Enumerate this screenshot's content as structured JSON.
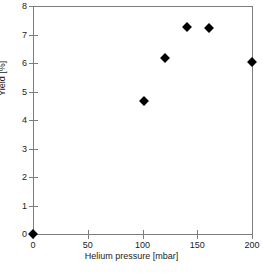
{
  "chart_data": {
    "type": "scatter",
    "title": "",
    "xlabel": "Helium pressure [mbar]",
    "ylabel": "Yield [%]",
    "xlim": [
      0,
      200
    ],
    "ylim": [
      0,
      8
    ],
    "xticks": [
      0,
      50,
      100,
      150,
      200
    ],
    "yticks": [
      0,
      1,
      2,
      3,
      4,
      5,
      6,
      7,
      8
    ],
    "xtick_labels": [
      "0",
      "50",
      "100",
      "150",
      "200"
    ],
    "ytick_labels": [
      "0",
      "1",
      "2",
      "3",
      "4",
      "5",
      "6",
      "7",
      "8"
    ],
    "grid": false,
    "legend": null,
    "marker_style": "filled-diamond",
    "marker_color": "#000000",
    "axis_color": "#7d7d7d",
    "series": [
      {
        "name": "Yield vs helium pressure",
        "points": [
          {
            "x": 0,
            "y": 0.0
          },
          {
            "x": 101,
            "y": 4.68
          },
          {
            "x": 121,
            "y": 6.17
          },
          {
            "x": 141,
            "y": 7.27
          },
          {
            "x": 161,
            "y": 7.22
          },
          {
            "x": 200,
            "y": 6.05
          }
        ]
      }
    ]
  }
}
